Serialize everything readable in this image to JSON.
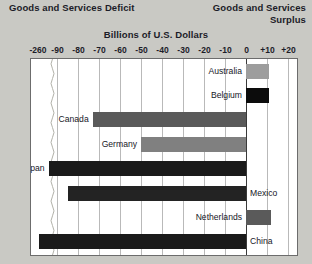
{
  "header": {
    "deficit_title": "Goods and Services Deficit",
    "surplus_title_line1": "Goods and Services",
    "surplus_title_line2": "Surplus",
    "units_title": "Billions of U.S. Dollars"
  },
  "chart_data": {
    "type": "bar",
    "orientation": "horizontal",
    "title": "Billions of U.S. Dollars",
    "xlabel": "Billions of U.S. Dollars",
    "ylabel": "",
    "grid": true,
    "legend": "none",
    "axis_break": {
      "after": -90,
      "label": "-260"
    },
    "xlim": [
      -260,
      20
    ],
    "tick_labels": [
      "-260",
      "-90",
      "-80",
      "-70",
      "-60",
      "-50",
      "-40",
      "-30",
      "-20",
      "-10",
      "0",
      "+10",
      "+20"
    ],
    "tick_values": [
      -260,
      -90,
      -80,
      -70,
      -60,
      -50,
      -40,
      -30,
      -20,
      -10,
      0,
      10,
      20
    ],
    "categories": [
      "Australia",
      "Belgium",
      "Canada",
      "Germany",
      "Japan",
      "Mexico",
      "Netherlands",
      "China"
    ],
    "values": [
      11,
      11,
      -73,
      -50,
      -94,
      -85,
      12,
      -260
    ],
    "bars": [
      {
        "label": "Australia",
        "value": 11,
        "color": "#9d9d9d",
        "label_side": "left"
      },
      {
        "label": "Belgium",
        "value": 11,
        "color": "#0c0c0c",
        "label_side": "left"
      },
      {
        "label": "Canada",
        "value": -73,
        "color": "#5a5a5a",
        "label_side": "left"
      },
      {
        "label": "Germany",
        "value": -50,
        "color": "#808080",
        "label_side": "left"
      },
      {
        "label": "Japan",
        "value": -94,
        "color": "#1a1a1a",
        "label_side": "left"
      },
      {
        "label": "Mexico",
        "value": -85,
        "color": "#232323",
        "label_side": "right"
      },
      {
        "label": "Netherlands",
        "value": 12,
        "color": "#5a5a5a",
        "label_side": "left"
      },
      {
        "label": "China",
        "value": -260,
        "color": "#1a1a1a",
        "label_side": "right"
      }
    ],
    "colors": {
      "plot_background": "#ffffff",
      "page_background": "#c9c9c4",
      "gridline": "#b9b9b9",
      "zero_line": "#3a3a3a",
      "text": "#1c1c28"
    }
  }
}
